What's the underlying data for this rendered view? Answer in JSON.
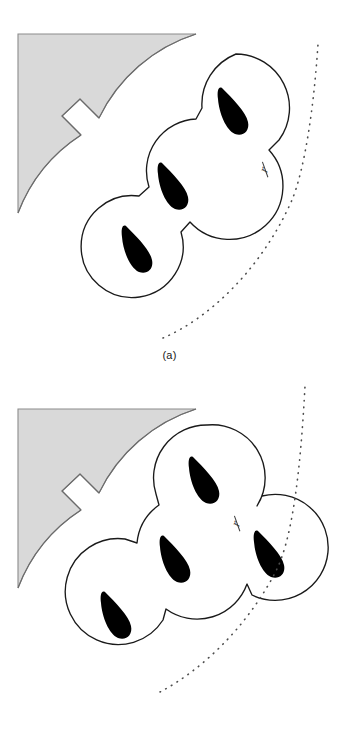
{
  "figure": {
    "background_color": "#ffffff",
    "width": 339,
    "height": 750,
    "outline_color": "#1a1a1a",
    "nucleus_color": "#000000",
    "substrate_fill": "#d9d9d9",
    "substrate_stroke": "#8c8c8c",
    "dotted_arc_color": "#4d4d4d",
    "label_color": "#1a1a1a"
  },
  "panels": [
    {
      "id": "a",
      "caption": "(a)",
      "description": "Linear chain of three lobes extending away from the substrate corner",
      "lobe_count": 3,
      "annotation_symbol": "r",
      "annotation_position": {
        "x": 265,
        "y": 170
      },
      "substrate": {
        "name": "substrate-corner",
        "arc_radius": 150,
        "notch_label": "notch"
      },
      "lobes": [
        {
          "cx": 236,
          "cy": 108,
          "r": 54,
          "nucleus_angle": 34
        },
        {
          "cx": 175,
          "cy": 184,
          "r": 52,
          "nucleus_angle": 34
        },
        {
          "cx": 139,
          "cy": 247,
          "r": 51,
          "nucleus_angle": 34
        }
      ],
      "dotted_arc": {
        "start_x": 163,
        "start_y": 338,
        "end_x": 318,
        "end_y": 44
      }
    },
    {
      "id": "b",
      "caption": "(b)",
      "description": "Branched arrangement of four lobes with a lateral bud",
      "lobe_count": 4,
      "annotation_symbol": "r",
      "annotation_position": {
        "x": 237,
        "y": 524
      },
      "substrate": {
        "name": "substrate-corner",
        "arc_radius": 150,
        "notch_label": "notch"
      },
      "lobes": [
        {
          "cx": 207,
          "cy": 478,
          "r": 53,
          "nucleus_angle": 34
        },
        {
          "cx": 178,
          "cy": 557,
          "r": 53,
          "nucleus_angle": 34
        },
        {
          "cx": 272,
          "cy": 552,
          "r": 53,
          "nucleus_angle": 34
        },
        {
          "cx": 119,
          "cy": 613,
          "r": 53,
          "nucleus_angle": 34
        }
      ],
      "dotted_arc": {
        "start_x": 160,
        "start_y": 692,
        "end_x": 305,
        "end_y": 386
      }
    }
  ],
  "legend": {
    "nucleus_label": "nucleus",
    "lobe_label": "lobe",
    "substrate_label": "substrate",
    "radius_label": "r"
  }
}
